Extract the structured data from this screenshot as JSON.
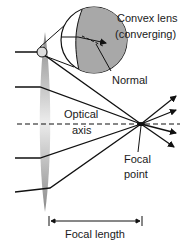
{
  "diagram": {
    "labels": {
      "lens_line1": "Convex lens",
      "lens_line2": "(converging)",
      "normal": "Normal",
      "axis_line1": "Optical",
      "axis_line2": "axis",
      "focal_line1": "Focal",
      "focal_line2": "point",
      "focal_length": "Focal length"
    },
    "colors": {
      "lens_edge": "#8a8a8a",
      "lens_center": "#e6e6e6",
      "magnifier_fill": "#a8a8a8",
      "line": "#111111"
    },
    "rays_incoming_y": [
      52,
      87,
      158,
      192
    ],
    "focal_point": [
      141,
      124
    ]
  }
}
